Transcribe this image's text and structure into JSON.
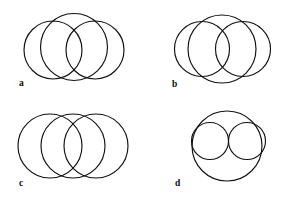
{
  "figure": {
    "background_color": "#ffffff",
    "stroke_color": "#111111",
    "stroke_width": 1.15,
    "width": 288,
    "height": 197,
    "panels": [
      {
        "id": "a",
        "label": "a",
        "label_x": 19,
        "label_y": 86,
        "description": "One large circle above two equal overlapping circles",
        "circles": [
          {
            "name": "large-top-circle",
            "cx": 74,
            "cy": 47,
            "r": 33.5
          },
          {
            "name": "left-circle",
            "cx": 53,
            "cy": 50,
            "r": 29
          },
          {
            "name": "right-circle",
            "cx": 95,
            "cy": 50,
            "r": 29
          }
        ]
      },
      {
        "id": "b",
        "label": "b",
        "label_x": 172,
        "label_y": 87,
        "description": "One large circle with two tangent medium circles overlapping its sides",
        "circles": [
          {
            "name": "large-circle",
            "cx": 222,
            "cy": 49,
            "r": 34
          },
          {
            "name": "left-circle",
            "cx": 202,
            "cy": 49,
            "r": 27.5
          },
          {
            "name": "right-circle",
            "cx": 243,
            "cy": 49,
            "r": 27.5
          }
        ]
      },
      {
        "id": "c",
        "label": "c",
        "label_x": 19,
        "label_y": 186,
        "description": "Three equal circles in a horizontal row, each overlapping its neighbour",
        "circles": [
          {
            "name": "left-circle",
            "cx": 50,
            "cy": 146,
            "r": 32
          },
          {
            "name": "middle-circle",
            "cx": 73,
            "cy": 146,
            "r": 32
          },
          {
            "name": "right-circle",
            "cx": 96,
            "cy": 146,
            "r": 32
          }
        ]
      },
      {
        "id": "d",
        "label": "d",
        "label_x": 175,
        "label_y": 186,
        "description": "One large circle containing two equal tangent circles",
        "circles": [
          {
            "name": "outer-circle",
            "cx": 227,
            "cy": 146,
            "r": 35
          },
          {
            "name": "inner-left-circle",
            "cx": 210,
            "cy": 141,
            "r": 18.5
          },
          {
            "name": "inner-right-circle",
            "cx": 247,
            "cy": 141,
            "r": 18.5
          }
        ]
      }
    ]
  }
}
